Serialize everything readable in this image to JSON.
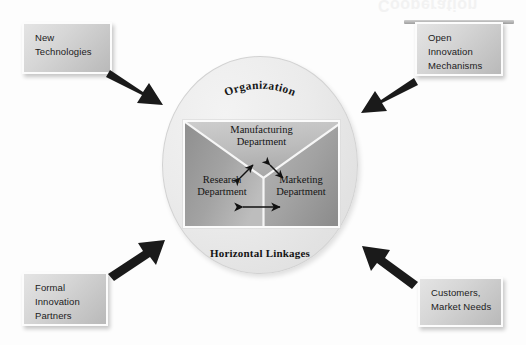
{
  "diagram": {
    "watermark_text": "Cooperation",
    "colors": {
      "arrow": "#1a1a1a",
      "box_fill_light": "#e4e4e4",
      "box_fill_dark": "#b9b9b9",
      "circle_fill": "#e8e8e8",
      "wedge_dark": "#9c9c9c",
      "wedge_mid": "#b4b4b4",
      "wedge_light": "#c6c6c6",
      "text": "#141414"
    }
  },
  "organization": {
    "top_label": "Organization",
    "bottom_label": "Horizontal Linkages"
  },
  "departments": [
    {
      "id": "manufacturing",
      "line1": "Manufacturing",
      "line2": "Department",
      "position": "top"
    },
    {
      "id": "research",
      "line1": "Research",
      "line2": "Department",
      "position": "bottom-left"
    },
    {
      "id": "marketing",
      "line1": "Marketing",
      "line2": "Department",
      "position": "bottom-right"
    }
  ],
  "internal_links": [
    {
      "from": "research",
      "to": "manufacturing",
      "type": "double-arrow"
    },
    {
      "from": "manufacturing",
      "to": "marketing",
      "type": "double-arrow"
    },
    {
      "from": "research",
      "to": "marketing",
      "type": "double-arrow"
    }
  ],
  "drivers": [
    {
      "id": "new-technologies",
      "lines": [
        "New",
        "Technologies"
      ],
      "corner": "top-left",
      "arrow_direction": "into-organization"
    },
    {
      "id": "open-innovation-mechanisms",
      "lines": [
        "Open",
        "Innovation",
        "Mechanisms"
      ],
      "corner": "top-right",
      "arrow_direction": "into-organization"
    },
    {
      "id": "formal-innovation-partners",
      "lines": [
        "Formal",
        "Innovation",
        "Partners"
      ],
      "corner": "bottom-left",
      "arrow_direction": "into-organization"
    },
    {
      "id": "customers-market-needs",
      "lines": [
        "Customers,",
        "Market Needs"
      ],
      "corner": "bottom-right",
      "arrow_direction": "into-organization"
    }
  ]
}
